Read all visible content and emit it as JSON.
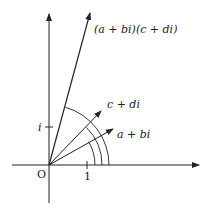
{
  "diagram": {
    "origin_label": "O",
    "real_tick_label": "1",
    "imag_tick_label": "i",
    "vectors": [
      {
        "id": "z1",
        "label": "a + bi"
      },
      {
        "id": "z2",
        "label": "c + di"
      },
      {
        "id": "product",
        "label": "(a + bi)(c + di)"
      }
    ],
    "arcs": [
      "angle of a + bi",
      "angle of c + di",
      "angle of product"
    ],
    "colors": {
      "stroke": "#222222",
      "background": "#ffffff"
    }
  }
}
